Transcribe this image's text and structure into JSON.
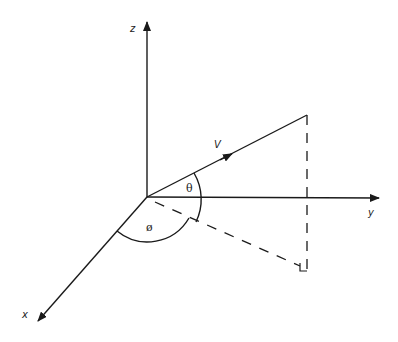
{
  "diagram": {
    "type": "3d-vector-spherical-angles",
    "labels": {
      "z_axis": "z",
      "y_axis": "y",
      "x_axis": "x",
      "vector": "V",
      "polar_angle": "θ",
      "azimuth_angle": "ø"
    },
    "colors": {
      "line": "#1a1a1a",
      "background": "#ffffff"
    },
    "elements": [
      {
        "name": "z-axis",
        "from": [
          147,
          197
        ],
        "to": [
          147,
          22
        ]
      },
      {
        "name": "y-axis",
        "from": [
          147,
          197
        ],
        "to": [
          379,
          198
        ]
      },
      {
        "name": "x-axis",
        "from": [
          147,
          197
        ],
        "to": [
          37,
          322
        ]
      },
      {
        "name": "vector-v",
        "from": [
          147,
          197
        ],
        "to": [
          307,
          115
        ]
      },
      {
        "name": "projection-vertical",
        "from": [
          307,
          115
        ],
        "to": [
          307,
          270
        ],
        "style": "dashed"
      },
      {
        "name": "projection-horizontal",
        "from": [
          147,
          197
        ],
        "to": [
          300,
          266
        ],
        "style": "dashed"
      }
    ]
  }
}
